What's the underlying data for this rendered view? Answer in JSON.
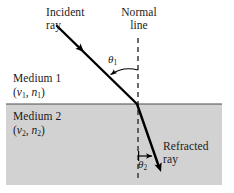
{
  "figure": {
    "type": "refraction-diagram",
    "width": 234,
    "height": 193,
    "background_color": "#ffffff",
    "medium2_fill_color": "#d2d2d2",
    "ray_color": "#000000",
    "text_color": "#1a1a1a"
  },
  "labels": {
    "incident_ray": "Incident\nray",
    "normal_line": "Normal\nline",
    "refracted_ray": "Refracted\nray",
    "medium1_name": "Medium 1",
    "medium2_name": "Medium 2",
    "theta1_symbol": "θ",
    "theta1_sub": "1",
    "theta2_symbol": "θ",
    "theta2_sub": "2",
    "medium1_v": "v",
    "medium1_v_sub": "1",
    "medium1_n": "n",
    "medium1_n_sub": "1",
    "medium2_v": "v",
    "medium2_v_sub": "2",
    "medium2_n": "n",
    "medium2_n_sub": "2",
    "paren_open": "(",
    "paren_close": ")",
    "comma": ","
  },
  "geometry": {
    "boundary_y": 104,
    "medium2_left": 6,
    "medium2_right": 222,
    "medium2_bottom": 185,
    "normal_x": 138,
    "normal_top_y": 38,
    "normal_bottom_y": 180,
    "incidence_point_x": 137,
    "incidence_point_y": 104,
    "incident_start_x": 57,
    "incident_start_y": 26,
    "refracted_end_x": 161,
    "refracted_end_y": 171
  }
}
